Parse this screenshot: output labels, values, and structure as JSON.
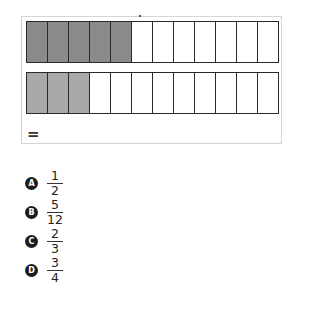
{
  "diagram": {
    "bars": [
      {
        "name": "top-bar",
        "total_parts": 12,
        "shaded_parts": 5,
        "shade_color": "#8a8a8a"
      },
      {
        "name": "bottom-bar",
        "total_parts": 12,
        "shaded_parts": 3,
        "shade_color": "#a9a9a9"
      }
    ],
    "equals_label": "="
  },
  "options": [
    {
      "letter": "A",
      "numerator": "1",
      "denominator": "2"
    },
    {
      "letter": "B",
      "numerator": "5",
      "denominator": "12"
    },
    {
      "letter": "C",
      "numerator": "2",
      "denominator": "3"
    },
    {
      "letter": "D",
      "numerator": "3",
      "denominator": "4"
    }
  ]
}
